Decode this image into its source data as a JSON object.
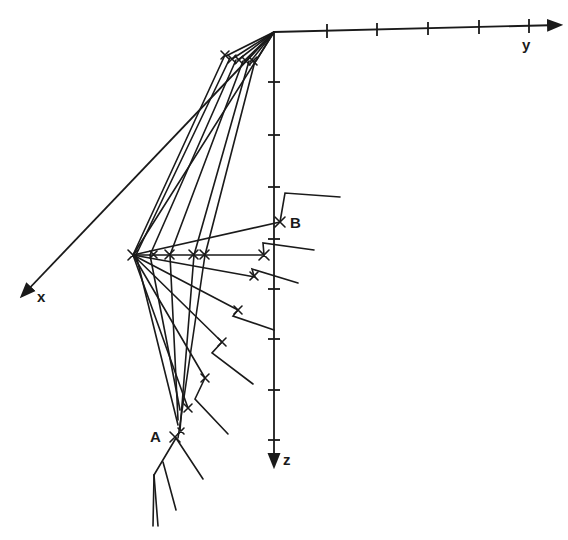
{
  "diagram": {
    "type": "3d-axes-line-diagram",
    "axes": {
      "origin": [
        274,
        32
      ],
      "y": {
        "label": "y",
        "end": [
          560,
          25
        ],
        "ticks_x": [
          327,
          377,
          428,
          479,
          529
        ]
      },
      "z": {
        "label": "z",
        "end": [
          274,
          468
        ],
        "ticks_y": [
          82,
          135,
          187,
          239,
          289,
          339,
          390,
          440
        ]
      },
      "x": {
        "label": "x",
        "end": [
          22,
          297
        ]
      }
    },
    "points": {
      "A": {
        "label": "A",
        "pos": [
          176,
          438
        ]
      },
      "B": {
        "label": "B",
        "pos": [
          280,
          222
        ]
      },
      "hub": [
        133,
        255
      ]
    },
    "colors": {
      "ink": "#1a1a1a",
      "background": "#ffffff"
    }
  }
}
